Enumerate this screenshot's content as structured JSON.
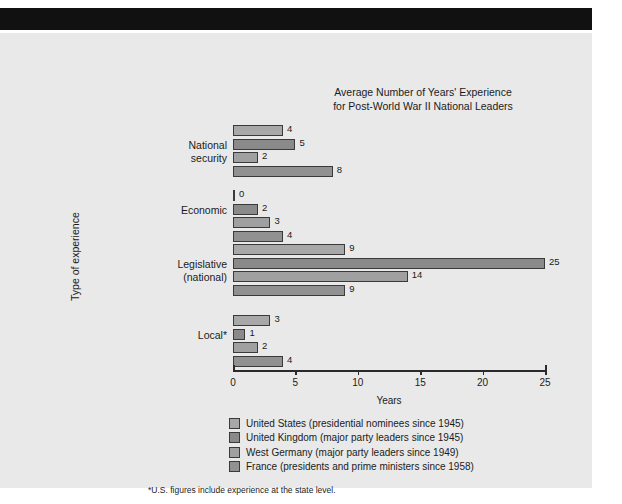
{
  "page": {
    "background_color": "#e9e9e9",
    "masthead_color": "#111111"
  },
  "footnote": "*U.S. figures include experience at the state level.",
  "chart_data": {
    "type": "bar",
    "orientation": "horizontal",
    "title": "Average Number of Years' Experience for Post-World War II National Leaders",
    "title_lines": [
      "Average Number of Years' Experience",
      "for Post-World War II National Leaders"
    ],
    "xlabel": "Years",
    "ylabel": "Type of experience",
    "xlim": [
      0,
      25
    ],
    "xticks": [
      0,
      5,
      10,
      15,
      20,
      25
    ],
    "xticklabels": [
      "0",
      "5",
      "10",
      "15",
      "20",
      "25"
    ],
    "grid": false,
    "legend_position": "below-axes",
    "categories": [
      "National security",
      "Economic",
      "Legislative (national)",
      "Local*"
    ],
    "category_label_lines": [
      [
        "National",
        "security"
      ],
      [
        "Economic"
      ],
      [
        "Legislative",
        "(national)"
      ],
      [
        "Local*"
      ]
    ],
    "series": [
      {
        "name": "United States (presidential nominees since 1945)",
        "short_name": "United States",
        "color": "#a8a8a8",
        "values": [
          4,
          0,
          9,
          3
        ]
      },
      {
        "name": "United Kingdom (major party leaders since 1945)",
        "short_name": "United Kingdom",
        "color": "#8a8a8a",
        "values": [
          5,
          2,
          25,
          1
        ]
      },
      {
        "name": "West Germany (major party leaders since 1949)",
        "short_name": "West Germany",
        "color": "#a0a0a0",
        "values": [
          2,
          3,
          14,
          2
        ]
      },
      {
        "name": "France (presidents and prime ministers since 1958)",
        "short_name": "France",
        "color": "#919191",
        "values": [
          8,
          4,
          9,
          4
        ]
      }
    ]
  }
}
